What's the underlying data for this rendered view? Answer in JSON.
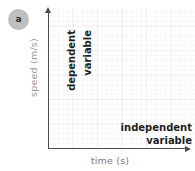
{
  "figure": {
    "panel_label": "a",
    "background_color": "#ffffff",
    "grid_color": "#eeeeee",
    "axis_color": "#4d4d4d",
    "annotation_color": "#1f1f1f",
    "axis_label_color": "#8c8c8c"
  },
  "chart_data": {
    "type": "line",
    "title": "",
    "subtitle": "",
    "xlabel": "time (s)",
    "ylabel": "speed (m/s)",
    "categories": [],
    "values": [],
    "series": [],
    "x": [],
    "xlim": [
      0,
      6
    ],
    "ylim": [
      0,
      6
    ],
    "grid": true,
    "legend": null,
    "annotations": [
      {
        "name": "dependent-variable-annotation",
        "text": "dependent variable",
        "lines": [
          "dependent",
          "variable"
        ],
        "orientation": "vertical",
        "position": "left-inside-y-axis"
      },
      {
        "name": "independent-variable-annotation",
        "text": "independent variable",
        "lines": [
          "independent",
          "variable"
        ],
        "orientation": "horizontal",
        "position": "bottom-right-inside"
      }
    ]
  }
}
